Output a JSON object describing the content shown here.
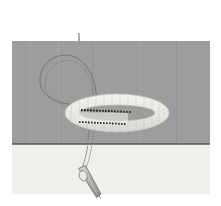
{
  "figure": {
    "kind": "sewing-instruction-illustration",
    "canvas": {
      "width": 221,
      "height": 206
    }
  },
  "caption": {
    "line1": "Leave a loop",
    "line2": "of thread",
    "full_text": "Leave a loop of thread",
    "color": "#8e8e90",
    "leader_line": {
      "from_x": 79,
      "from_y": 33,
      "to_x": 79,
      "to_y": 76,
      "color": "#6f6f72"
    }
  },
  "panels": [
    {
      "name": "upper-fabric-panel",
      "label": "Fabric (right side, gray)",
      "color": "#9d9d9f",
      "x": 12,
      "y": 41,
      "width": 198,
      "height": 103
    },
    {
      "name": "lower-fabric-panel",
      "label": "Fabric (underside, light)",
      "color": "#efefec",
      "x": 12,
      "y": 144,
      "width": 198,
      "height": 50
    }
  ],
  "edge_line": {
    "name": "fold-edge",
    "color": "#58585b",
    "y": 144,
    "x_start": 12,
    "x_end": 210
  },
  "elements": [
    {
      "name": "thread-loop",
      "label": "Leave a loop of thread",
      "stroke": "#77777a",
      "stroke_width": 0.9,
      "fill": "none"
    },
    {
      "name": "elastic-loop-ring",
      "label": "Elastic / ribbon loop",
      "fill": "#e9e9e6",
      "stroke": "#c9c9c6",
      "center_x": 117,
      "center_y": 113,
      "rx": 52,
      "ry": 19
    },
    {
      "name": "stitch-line-upper",
      "label": "Running stitch line (upper)",
      "color": "#2f2f31",
      "stitch_count": 22
    },
    {
      "name": "stitch-line-lower",
      "label": "Running stitch line (lower)",
      "color": "#2f2f31",
      "stitch_count": 20
    },
    {
      "name": "needle",
      "label": "Sewing needle",
      "body_fill": "#b8b8b6",
      "outline": "#6e6e71",
      "eye_fill": "#e8e8e6",
      "angle_deg": 28
    },
    {
      "name": "needle-thread",
      "label": "Thread trailing from needle",
      "stroke": "#8a8a8d"
    }
  ],
  "colors": {
    "background": "#ffffff",
    "fabric_upper": "#9d9d9f",
    "fabric_lower": "#efefec",
    "edge": "#58585b",
    "thread": "#77777a",
    "stitch": "#2f2f31",
    "caption": "#8e8e90",
    "loop_fill": "#e9e9e6"
  }
}
